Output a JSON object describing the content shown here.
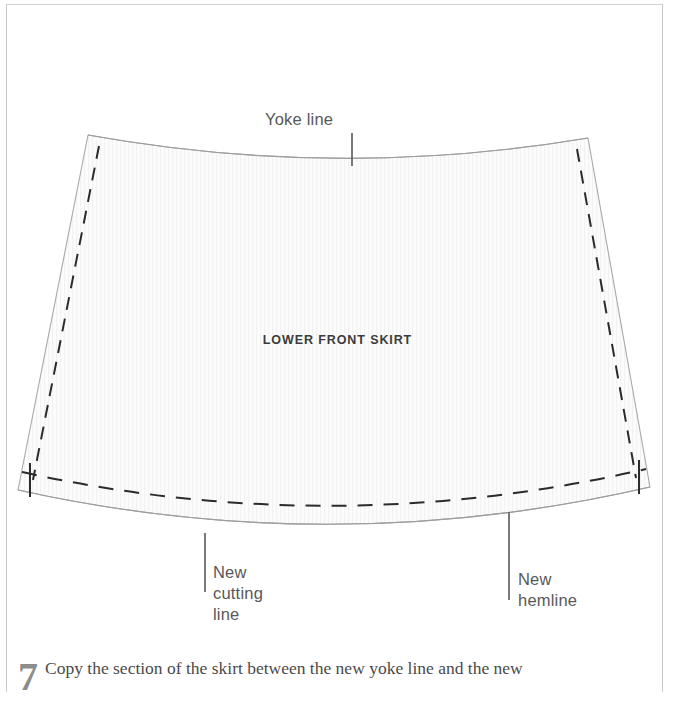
{
  "page": {
    "background_color": "#ffffff",
    "border_color": "#c8c8c8"
  },
  "diagram": {
    "piece_label": "LOWER FRONT SKIRT",
    "fill_color": "#fbfbfb",
    "outline_color": "#9a9a9a",
    "dash_color": "#2b2b2b",
    "leader_color": "#58585a",
    "callouts": [
      {
        "id": "yoke",
        "label": "Yoke line"
      },
      {
        "id": "cutting",
        "label": "New\ncutting\nline"
      },
      {
        "id": "hemline",
        "label": "New\nhemline"
      }
    ]
  },
  "caption": {
    "number": "7",
    "text": "Copy the section of the skirt between the new yoke line and the new"
  }
}
